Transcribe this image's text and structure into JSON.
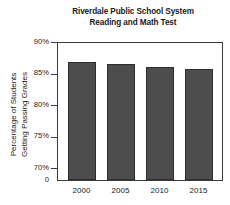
{
  "chart_data": {
    "type": "bar",
    "title": "Riverdale Public School System Reading and Math Test",
    "title_lines": [
      "Riverdale Public School System",
      "Reading and Math Test"
    ],
    "xlabel": "",
    "ylabel": "Percentage of Students Getting Passing Grades",
    "ylabel_lines": [
      "Percentage of Students",
      "Getting Passing Grades"
    ],
    "categories": [
      "2000",
      "2005",
      "2010",
      "2015"
    ],
    "values": [
      86.8,
      86.5,
      86.0,
      85.7
    ],
    "ylim": [
      68,
      90
    ],
    "yticks": [
      {
        "value": 90,
        "label": "90%"
      },
      {
        "value": 85,
        "label": "85%"
      },
      {
        "value": 80,
        "label": "80%"
      },
      {
        "value": 75,
        "label": "75%"
      },
      {
        "value": 70,
        "label": "70%"
      }
    ],
    "baseline_label": "0",
    "axis_break": true,
    "grid": false,
    "legend": null,
    "bar_color": "#4d4d4d",
    "bar_edge_color": "#2e2e2e",
    "frame_color": "#3a3a3a",
    "background_color": "#ffffff"
  }
}
